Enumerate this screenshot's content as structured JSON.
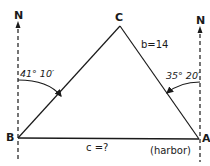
{
  "diagram": {
    "type": "navigation triangle",
    "colors": {
      "stroke": "#1a1a1a",
      "background": "#ffffff"
    },
    "north_markers": [
      {
        "id": "north-left",
        "label": "N",
        "at_vertex": "B"
      },
      {
        "id": "north-right",
        "label": "N",
        "at_vertex": "A"
      }
    ],
    "vertices": [
      {
        "id": "C",
        "label": "C"
      },
      {
        "id": "B",
        "label": "B"
      },
      {
        "id": "A",
        "label": "A",
        "note": "(harbor)"
      }
    ],
    "sides": [
      {
        "id": "b",
        "between": [
          "A",
          "C"
        ],
        "label": "b=14"
      },
      {
        "id": "c",
        "between": [
          "B",
          "A"
        ],
        "label": "c =?"
      },
      {
        "id": "a",
        "between": [
          "B",
          "C"
        ],
        "label": ""
      }
    ],
    "angles": [
      {
        "at": "B",
        "label": "41° 10′",
        "from": "north",
        "to": "BC"
      },
      {
        "at": "A",
        "label": "35° 20′",
        "from": "north",
        "to": "AC"
      }
    ]
  }
}
